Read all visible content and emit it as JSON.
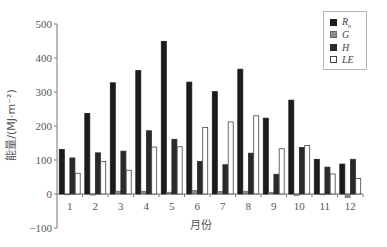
{
  "chart_data": {
    "type": "bar",
    "title": "",
    "xlabel": "月份",
    "ylabel": "能量/(MJ·m⁻²)",
    "ylim": [
      -100,
      500
    ],
    "yticks": [
      -100,
      0,
      100,
      200,
      300,
      400,
      500
    ],
    "grid": false,
    "legend_position": "top-right",
    "categories": [
      "1",
      "2",
      "3",
      "4",
      "5",
      "6",
      "7",
      "8",
      "9",
      "10",
      "11",
      "12"
    ],
    "series": [
      {
        "name": "Rn",
        "label_main": "R",
        "label_sub": "n",
        "color": "#1c1c1c",
        "border": "#1c1c1c",
        "values": [
          131,
          237,
          327,
          363,
          449,
          329,
          301,
          367,
          223,
          276,
          102,
          88
        ]
      },
      {
        "name": "G",
        "label_main": "G",
        "label_sub": "",
        "color": "#8c8c8c",
        "border": "#6a6a6a",
        "values": [
          -2,
          -3,
          8,
          8,
          5,
          10,
          7,
          8,
          5,
          -4,
          -2,
          -10
        ]
      },
      {
        "name": "H",
        "label_main": "H",
        "label_sub": "",
        "color": "#2a2a2a",
        "border": "#2a2a2a",
        "values": [
          106,
          121,
          126,
          186,
          161,
          96,
          86,
          120,
          58,
          137,
          79,
          102
        ]
      },
      {
        "name": "LE",
        "label_main": "LE",
        "label_sub": "",
        "color": "#ffffff",
        "border": "#444444",
        "values": [
          61,
          96,
          70,
          138,
          139,
          196,
          212,
          230,
          133,
          143,
          59,
          46
        ]
      }
    ]
  }
}
